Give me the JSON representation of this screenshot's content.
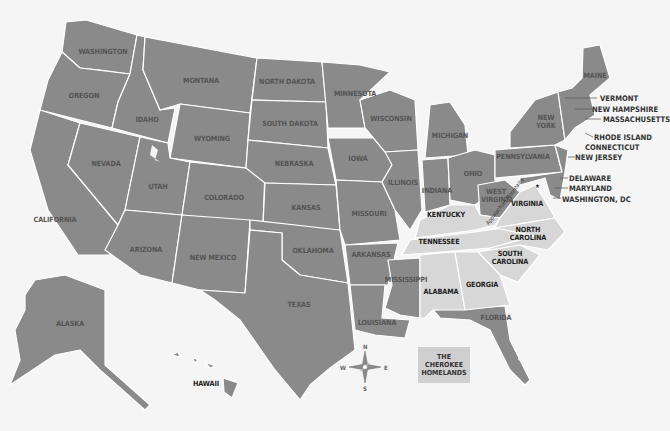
{
  "map": {
    "title": "The Cherokee Homelands",
    "colors": {
      "background": "#f5f5f5",
      "state": "#8a8a8a",
      "cherokee_homelands": "#d7d7d7",
      "border": "#ffffff"
    },
    "states": [
      {
        "name": "WASHINGTON"
      },
      {
        "name": "OREGON"
      },
      {
        "name": "CALIFORNIA"
      },
      {
        "name": "IDAHO"
      },
      {
        "name": "NEVADA"
      },
      {
        "name": "MONTANA"
      },
      {
        "name": "WYOMING"
      },
      {
        "name": "UTAH"
      },
      {
        "name": "ARIZONA"
      },
      {
        "name": "COLORADO"
      },
      {
        "name": "NEW MEXICO"
      },
      {
        "name": "NORTH DAKOTA"
      },
      {
        "name": "SOUTH DAKOTA"
      },
      {
        "name": "NEBRASKA"
      },
      {
        "name": "KANSAS"
      },
      {
        "name": "OKLAHOMA"
      },
      {
        "name": "TEXAS"
      },
      {
        "name": "MINNESOTA"
      },
      {
        "name": "IOWA"
      },
      {
        "name": "MISSOURI"
      },
      {
        "name": "ARKANSAS"
      },
      {
        "name": "LOUISIANA"
      },
      {
        "name": "WISCONSIN"
      },
      {
        "name": "ILLINOIS"
      },
      {
        "name": "MICHIGAN"
      },
      {
        "name": "INDIANA"
      },
      {
        "name": "OHIO"
      },
      {
        "name": "MISSISSIPPI"
      },
      {
        "name": "KENTUCKY"
      },
      {
        "name": "TENNESSEE"
      },
      {
        "name": "ALABAMA"
      },
      {
        "name": "GEORGIA"
      },
      {
        "name": "FLORIDA"
      },
      {
        "name": "WEST VIRGINIA"
      },
      {
        "name": "VIRGINIA"
      },
      {
        "name": "NORTH CAROLINA"
      },
      {
        "name": "SOUTH CAROLINA"
      },
      {
        "name": "PENNSYLVANIA"
      },
      {
        "name": "NEW YORK"
      },
      {
        "name": "MAINE"
      },
      {
        "name": "ALASKA"
      },
      {
        "name": "HAWAII"
      }
    ],
    "callouts": [
      "VERMONT",
      "NEW HAMPSHIRE",
      "MASSACHUSETTS",
      "RHODE ISLAND",
      "CONNECTICUT",
      "NEW JERSEY",
      "DELAWARE",
      "MARYLAND",
      "WASHINGTON, DC"
    ],
    "feature_label": "Appalachian Mountains",
    "legend": {
      "label": "THE CHEROKEE HOMELANDS"
    },
    "compass": {
      "n": "N",
      "s": "S",
      "e": "E",
      "w": "W"
    }
  }
}
